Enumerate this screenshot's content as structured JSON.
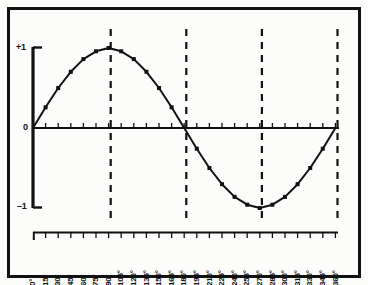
{
  "figure": {
    "background_color": "#fbfbf9",
    "frame_color": "#111111",
    "ink_color": "#111111"
  },
  "axes": {
    "y_axis_labels": {
      "positive_one": "+1",
      "zero": "0",
      "negative_one": "–1"
    },
    "x_axis_ticks": [
      "0°",
      "15°",
      "30°",
      "45°",
      "60°",
      "75°",
      "90°",
      "105°",
      "120°",
      "135°",
      "150°",
      "165°",
      "180°",
      "195°",
      "210°",
      "225°",
      "240°",
      "255°",
      "270°",
      "285°",
      "300°",
      "315°",
      "330°",
      "345°",
      "360°"
    ]
  },
  "chart_data": {
    "type": "line",
    "title": "",
    "subtitle": "",
    "xlabel": "",
    "ylabel": "",
    "grid": false,
    "legend": null,
    "marker": "square",
    "xlim": [
      0,
      360
    ],
    "ylim": [
      -1,
      1
    ],
    "yticks": [
      -1,
      0,
      1
    ],
    "ytick_labels": [
      "–1",
      "0",
      "+1"
    ],
    "x_unit": "degrees",
    "x_step": 15,
    "x": [
      0,
      15,
      30,
      45,
      60,
      75,
      90,
      105,
      120,
      135,
      150,
      165,
      180,
      195,
      210,
      225,
      240,
      255,
      270,
      285,
      300,
      315,
      330,
      345,
      360
    ],
    "xtick_labels": [
      "0°",
      "15°",
      "30°",
      "45°",
      "60°",
      "75°",
      "90°",
      "105°",
      "120°",
      "135°",
      "150°",
      "165°",
      "180°",
      "195°",
      "210°",
      "225°",
      "240°",
      "255°",
      "270°",
      "285°",
      "300°",
      "315°",
      "330°",
      "345°",
      "360°"
    ],
    "series": [
      {
        "name": "sine",
        "values": [
          0.0,
          0.259,
          0.5,
          0.707,
          0.866,
          0.966,
          1.0,
          0.966,
          0.866,
          0.707,
          0.5,
          0.259,
          0.0,
          -0.259,
          -0.5,
          -0.707,
          -0.866,
          -0.966,
          -1.0,
          -0.966,
          -0.866,
          -0.707,
          -0.5,
          -0.259,
          0.0
        ]
      }
    ],
    "annotations": {
      "dashed_vertical_lines_at": [
        90,
        180,
        270,
        360
      ]
    }
  }
}
